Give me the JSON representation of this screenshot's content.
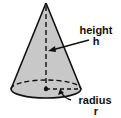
{
  "figure": {
    "labels": {
      "height_word": "height",
      "height_symbol": "h",
      "radius_word": "radius",
      "radius_symbol": "r"
    },
    "colors": {
      "fill": "#c8c8c8",
      "stroke": "#111111",
      "background": "#ffffff"
    }
  }
}
